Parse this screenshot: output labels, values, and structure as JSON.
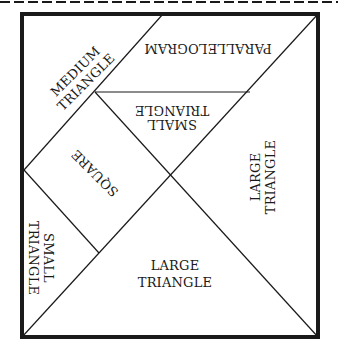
{
  "diagram": {
    "type": "tangram-layout",
    "colors": {
      "line": "#1a1a1a",
      "background": "#ffffff"
    },
    "pieces": {
      "medium_triangle": {
        "line1": "MEDIUM",
        "line2": "TRIANGLE"
      },
      "parallelogram": {
        "label": "PARALLELOGRAM"
      },
      "small_triangle_top": {
        "line1": "SMALL",
        "line2": "TRIANGLE"
      },
      "square": {
        "label": "SQUARE"
      },
      "large_triangle_right": {
        "line1": "LARGE",
        "line2": "TRIANGLE"
      },
      "small_triangle_left": {
        "line1": "SMALL",
        "line2": "TRIANGLE"
      },
      "large_triangle_bottom": {
        "line1": "LARGE",
        "line2": "TRIANGLE"
      }
    }
  }
}
